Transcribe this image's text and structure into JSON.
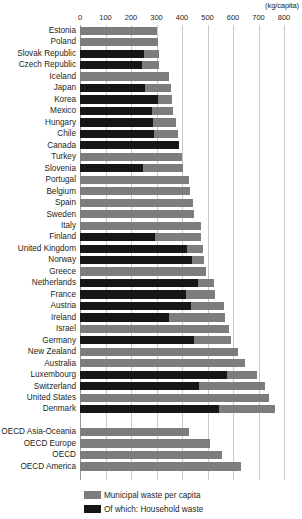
{
  "chart_data": {
    "type": "bar",
    "orientation": "horizontal",
    "title": "",
    "units_caption": "(kg/capita)",
    "xlabel": "",
    "ylabel": "",
    "xlim": [
      0,
      800
    ],
    "xticks": [
      0,
      100,
      200,
      300,
      400,
      500,
      600,
      700,
      800
    ],
    "xtick_labels": [
      "0",
      "100",
      "200",
      "300",
      "400",
      "500",
      "600",
      "700",
      "800"
    ],
    "grid": true,
    "legend_position": "bottom",
    "colors": {
      "municipal": "#7d7d7d",
      "household": "#161616",
      "gridline": "#c9c9c9",
      "text": "#231f20"
    },
    "series": [
      {
        "name": "Municipal waste per capita",
        "key": "municipal",
        "color": "#7d7d7d"
      },
      {
        "name": "Of which: Household waste",
        "key": "household",
        "color": "#161616"
      }
    ],
    "categories": [
      "Estonia",
      "Poland",
      "Slovak Republic",
      "Czech Republic",
      "Iceland",
      "Japan",
      "Korea",
      "Mexico",
      "Hungary",
      "Chile",
      "Canada",
      "Turkey",
      "Slovenia",
      "Portugal",
      "Belgium",
      "Spain",
      "Sweden",
      "Italy",
      "Finland",
      "United Kingdom",
      "Norway",
      "Greece",
      "Netherlands",
      "France",
      "Austria",
      "Ireland",
      "Israel",
      "Germany",
      "New Zealand",
      "Australia",
      "Luxembourg",
      "Switzerland",
      "United States",
      "Denmark",
      "",
      "OECD Asia-Oceania",
      "OECD Europe",
      "OECD",
      "OECD America"
    ],
    "rows": [
      {
        "label": "Estonia",
        "municipal": 302,
        "household": 0
      },
      {
        "label": "Poland",
        "municipal": 307,
        "household": 0
      },
      {
        "label": "Slovak Republic",
        "municipal": 308,
        "household": 251
      },
      {
        "label": "Czech Republic",
        "municipal": 311,
        "household": 243
      },
      {
        "label": "Iceland",
        "municipal": 350,
        "household": 0
      },
      {
        "label": "Japan",
        "municipal": 355,
        "household": 256
      },
      {
        "label": "Korea",
        "municipal": 361,
        "household": 305
      },
      {
        "label": "Mexico",
        "municipal": 363,
        "household": 281
      },
      {
        "label": "Hungary",
        "municipal": 378,
        "household": 288
      },
      {
        "label": "Chile",
        "municipal": 384,
        "household": 289
      },
      {
        "label": "Canada",
        "municipal": 389,
        "household": 389
      },
      {
        "label": "Turkey",
        "municipal": 400,
        "household": 0
      },
      {
        "label": "Slovenia",
        "municipal": 404,
        "household": 248
      },
      {
        "label": "Portugal",
        "municipal": 429,
        "household": 0
      },
      {
        "label": "Belgium",
        "municipal": 433,
        "household": 0
      },
      {
        "label": "Spain",
        "municipal": 443,
        "household": 0
      },
      {
        "label": "Sweden",
        "municipal": 447,
        "household": 0
      },
      {
        "label": "Italy",
        "municipal": 473,
        "household": 0
      },
      {
        "label": "Finland",
        "municipal": 476,
        "household": 294
      },
      {
        "label": "United Kingdom",
        "municipal": 482,
        "household": 419
      },
      {
        "label": "Norway",
        "municipal": 487,
        "household": 440
      },
      {
        "label": "Greece",
        "municipal": 494,
        "household": 0
      },
      {
        "label": "Netherlands",
        "municipal": 526,
        "household": 461
      },
      {
        "label": "France",
        "municipal": 530,
        "household": 414
      },
      {
        "label": "Austria",
        "municipal": 565,
        "household": 436
      },
      {
        "label": "Ireland",
        "municipal": 569,
        "household": 350
      },
      {
        "label": "Israel",
        "municipal": 585,
        "household": 0
      },
      {
        "label": "Germany",
        "municipal": 593,
        "household": 448
      },
      {
        "label": "New Zealand",
        "municipal": 620,
        "household": 0
      },
      {
        "label": "Australia",
        "municipal": 647,
        "household": 0
      },
      {
        "label": "Luxembourg",
        "municipal": 694,
        "household": 577
      },
      {
        "label": "Switzerland",
        "municipal": 725,
        "household": 465
      },
      {
        "label": "United States",
        "municipal": 741,
        "household": 0
      },
      {
        "label": "Denmark",
        "municipal": 765,
        "household": 545
      },
      {
        "label": "",
        "municipal": 0,
        "household": 0
      },
      {
        "label": "OECD Asia-Oceania",
        "municipal": 428,
        "household": 0
      },
      {
        "label": "OECD Europe",
        "municipal": 510,
        "household": 0
      },
      {
        "label": "OECD",
        "municipal": 557,
        "household": 0
      },
      {
        "label": "OECD America",
        "municipal": 631,
        "household": 0
      }
    ]
  }
}
